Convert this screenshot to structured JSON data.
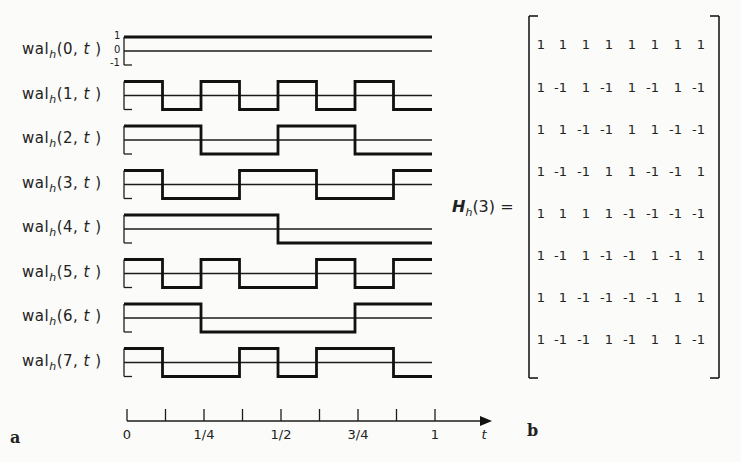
{
  "figure": {
    "panel_a_label": "a",
    "panel_b_label": "b",
    "y_tick_labels": [
      "1",
      "0",
      "-1"
    ],
    "waveform_label_prefix": "wal",
    "waveform_label_subscript": "h",
    "time_var": "t"
  },
  "chart_data": {
    "type": "line",
    "xlabel": "t",
    "ylabel": "",
    "xlim": [
      0,
      1
    ],
    "ylim": [
      -1,
      1
    ],
    "x_ticks": [
      0,
      0.125,
      0.25,
      0.375,
      0.5,
      0.625,
      0.75,
      0.875,
      1
    ],
    "x_tick_labels": [
      "0",
      "",
      "1/4",
      "",
      "1/2",
      "",
      "3/4",
      "",
      "1"
    ],
    "segments_per_unit": 8,
    "series": [
      {
        "name": "wal_h(0,t)",
        "values": [
          1,
          1,
          1,
          1,
          1,
          1,
          1,
          1
        ]
      },
      {
        "name": "wal_h(1,t)",
        "values": [
          1,
          -1,
          1,
          -1,
          1,
          -1,
          1,
          -1
        ]
      },
      {
        "name": "wal_h(2,t)",
        "values": [
          1,
          1,
          -1,
          -1,
          1,
          1,
          -1,
          -1
        ]
      },
      {
        "name": "wal_h(3,t)",
        "values": [
          1,
          -1,
          -1,
          1,
          1,
          -1,
          -1,
          1
        ]
      },
      {
        "name": "wal_h(4,t)",
        "values": [
          1,
          1,
          1,
          1,
          -1,
          -1,
          -1,
          -1
        ]
      },
      {
        "name": "wal_h(5,t)",
        "values": [
          1,
          -1,
          1,
          -1,
          -1,
          1,
          -1,
          1
        ]
      },
      {
        "name": "wal_h(6,t)",
        "values": [
          1,
          1,
          -1,
          -1,
          -1,
          -1,
          1,
          1
        ]
      },
      {
        "name": "wal_h(7,t)",
        "values": [
          1,
          -1,
          -1,
          1,
          -1,
          1,
          1,
          -1
        ]
      }
    ]
  },
  "matrix": {
    "label_symbol": "H",
    "label_subscript": "h",
    "label_arg": "(3) =",
    "rows": [
      [
        "1",
        "1",
        "1",
        "1",
        "1",
        "1",
        "1",
        "1"
      ],
      [
        "1",
        "-1",
        "1",
        "-1",
        "1",
        "-1",
        "1",
        "-1"
      ],
      [
        "1",
        "1",
        "-1",
        "-1",
        "1",
        "1",
        "-1",
        "-1"
      ],
      [
        "1",
        "-1",
        "-1",
        "1",
        "1",
        "-1",
        "-1",
        "1"
      ],
      [
        "1",
        "1",
        "1",
        "1",
        "-1",
        "-1",
        "-1",
        "-1"
      ],
      [
        "1",
        "-1",
        "1",
        "-1",
        "-1",
        "1",
        "-1",
        "1"
      ],
      [
        "1",
        "1",
        "-1",
        "-1",
        "-1",
        "-1",
        "1",
        "1"
      ],
      [
        "1",
        "-1",
        "-1",
        "1",
        "-1",
        "1",
        "1",
        "-1"
      ]
    ]
  }
}
